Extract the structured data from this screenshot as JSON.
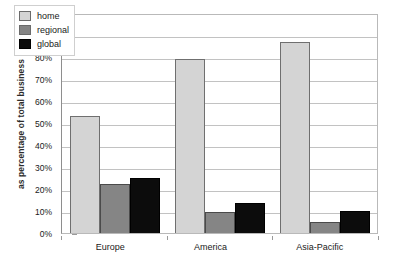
{
  "chart_data": {
    "type": "bar",
    "title": "",
    "subtitle": "",
    "xlabel": "",
    "ylabel": "as percentage of total business",
    "categories": [
      "Europe",
      "America",
      "Asia-Pacific"
    ],
    "series": [
      {
        "name": "home",
        "color": "#d4d4d4",
        "values": [
          53,
          79,
          87
        ]
      },
      {
        "name": "regional",
        "color": "#858585",
        "values": [
          22.5,
          9.5,
          5
        ]
      },
      {
        "name": "global",
        "color": "#0c0c0c",
        "values": [
          25,
          13.5,
          10
        ]
      }
    ],
    "ylim": [
      0,
      100
    ],
    "ytick_values": [
      0,
      10,
      20,
      30,
      40,
      50,
      60,
      70,
      80,
      90,
      100
    ],
    "ytick_labels": [
      "0%",
      "10%",
      "20%",
      "30%",
      "40%",
      "50%",
      "60%",
      "70%",
      "80%",
      "90%",
      "100%"
    ],
    "grid": "horizontal",
    "legend_position": "top-left-inside",
    "legend_entries": [
      "home",
      "regional",
      "global"
    ]
  },
  "colors": {
    "background": "#ffffff",
    "axis": "#8e8e8e",
    "gridline": "#c2c2c2",
    "frame": "#b9b9b9",
    "text": "#1a1a1a",
    "home": "#d4d4d4",
    "regional": "#858585",
    "global": "#0c0c0c"
  }
}
